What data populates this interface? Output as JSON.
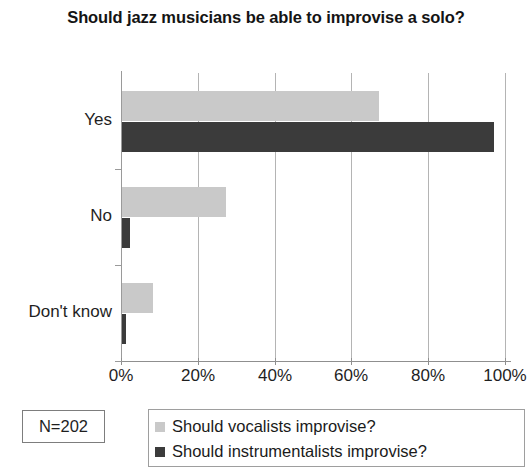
{
  "chart_data": {
    "type": "bar",
    "orientation": "horizontal",
    "title": "Should jazz musicians be able to improvise a solo?",
    "categories": [
      "Yes",
      "No",
      "Don't know"
    ],
    "series": [
      {
        "name": "Should vocalists improvise?",
        "color": "#c9c9c9",
        "values": [
          67,
          27,
          8
        ]
      },
      {
        "name": "Should instrumentalists improvise?",
        "color": "#3b3b3b",
        "values": [
          97,
          2,
          1
        ]
      }
    ],
    "xlabel": "",
    "ylabel": "",
    "xlim": [
      0,
      100
    ],
    "xticks": [
      "0%",
      "20%",
      "40%",
      "60%",
      "80%",
      "100%"
    ],
    "xtick_values": [
      0,
      20,
      40,
      60,
      80,
      100
    ],
    "grid": true,
    "legend_position": "bottom",
    "annotation": "N=202"
  },
  "chart": {
    "title": "Should jazz musicians be able to improvise a solo?",
    "sample_size_label": "N=202"
  }
}
